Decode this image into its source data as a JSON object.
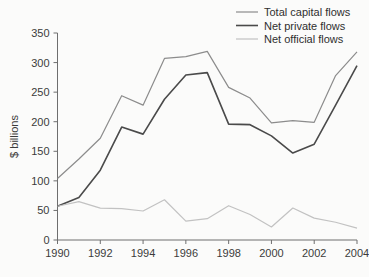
{
  "chart_data": {
    "type": "line",
    "title": "",
    "subtitle": "",
    "xlabel": "",
    "ylabel": "$ billions",
    "x": [
      1990,
      1991,
      1992,
      1993,
      1994,
      1995,
      1996,
      1997,
      1998,
      1999,
      2000,
      2001,
      2002,
      2003,
      2004
    ],
    "xlim": [
      1990,
      2004
    ],
    "ylim": [
      0,
      350
    ],
    "xticks": [
      1990,
      1992,
      1994,
      1996,
      1998,
      2000,
      2002,
      2004
    ],
    "xtick_labels": [
      "1990",
      "1992",
      "1994",
      "1996",
      "1998",
      "2000",
      "2002",
      "2004"
    ],
    "yticks": [
      0,
      50,
      100,
      150,
      200,
      250,
      300,
      350
    ],
    "ytick_labels": [
      "0",
      "50",
      "100",
      "150",
      "200",
      "250",
      "300",
      "350"
    ],
    "grid": false,
    "legend_position": "top-right",
    "series": [
      {
        "name": "Total capital flows",
        "color": "#8c8c8c",
        "width": 1.2,
        "values": [
          104,
          137,
          172,
          244,
          228,
          307,
          310,
          319,
          258,
          240,
          198,
          202,
          199,
          278,
          318
        ]
      },
      {
        "name": "Net private flows",
        "color": "#4a4a4a",
        "width": 1.6,
        "values": [
          57,
          72,
          118,
          191,
          179,
          238,
          279,
          283,
          196,
          195,
          176,
          147,
          162,
          228,
          295
        ]
      },
      {
        "name": "Net official flows",
        "color": "#c2c2c2",
        "width": 1.2,
        "values": [
          57,
          65,
          54,
          53,
          49,
          68,
          32,
          36,
          58,
          43,
          22,
          54,
          37,
          30,
          20
        ]
      }
    ]
  },
  "legend": {
    "items": [
      {
        "label": "Total capital flows"
      },
      {
        "label": "Net private flows"
      },
      {
        "label": "Net official flows"
      }
    ]
  },
  "axes": {
    "y_axis_title": "$ billions"
  },
  "colors": {
    "total": "#8c8c8c",
    "private": "#4a4a4a",
    "official": "#c2c2c2",
    "axis": "#6e6e6e",
    "text": "#3b3b3b",
    "background": "#fbfbfa"
  }
}
